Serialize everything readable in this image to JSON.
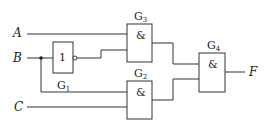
{
  "diagram": {
    "type": "logic-circuit",
    "inputs": [
      {
        "id": "A",
        "label": "A"
      },
      {
        "id": "B",
        "label": "B"
      },
      {
        "id": "C",
        "label": "C"
      }
    ],
    "output": {
      "id": "F",
      "label": "F"
    },
    "gates": [
      {
        "id": "G1",
        "name": "G",
        "sub": "1",
        "symbol": "1",
        "type": "NOT",
        "inputs": [
          "B"
        ]
      },
      {
        "id": "G2",
        "name": "G",
        "sub": "2",
        "symbol": "&",
        "type": "AND",
        "inputs": [
          "B",
          "C"
        ]
      },
      {
        "id": "G3",
        "name": "G",
        "sub": "3",
        "symbol": "&",
        "type": "AND",
        "inputs": [
          "A",
          "G1"
        ]
      },
      {
        "id": "G4",
        "name": "G",
        "sub": "4",
        "symbol": "&",
        "type": "AND",
        "inputs": [
          "G3",
          "G2"
        ]
      }
    ],
    "colors": {
      "line": "#333333",
      "text": "#222222",
      "background": "#ffffff"
    }
  }
}
